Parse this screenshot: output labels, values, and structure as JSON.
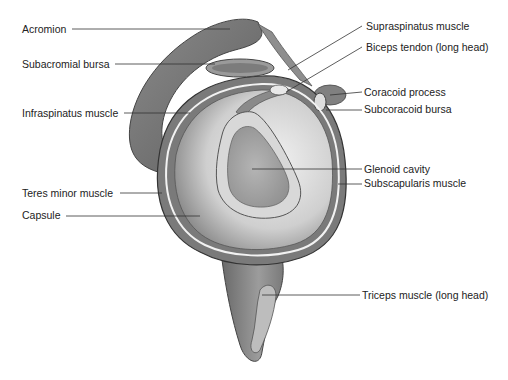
{
  "diagram": {
    "labels_left": [
      {
        "id": "acromion",
        "text": "Acromion",
        "x": 22,
        "y": 23
      },
      {
        "id": "subacromial-bursa",
        "text": "Subacromial bursa",
        "x": 22,
        "y": 58
      },
      {
        "id": "infraspinatus-muscle",
        "text": "Infraspinatus muscle",
        "x": 22,
        "y": 107
      },
      {
        "id": "teres-minor-muscle",
        "text": "Teres minor muscle",
        "x": 22,
        "y": 187
      },
      {
        "id": "capsule",
        "text": "Capsule",
        "x": 22,
        "y": 209
      }
    ],
    "labels_right": [
      {
        "id": "supraspinatus-muscle",
        "text": "Supraspinatus muscle",
        "x": 366,
        "y": 20
      },
      {
        "id": "biceps-tendon",
        "text": "Biceps tendon (long head)",
        "x": 366,
        "y": 41
      },
      {
        "id": "coracoid-process",
        "text": "Coracoid process",
        "x": 364,
        "y": 86
      },
      {
        "id": "subcoracoid-bursa",
        "text": "Subcoracoid bursa",
        "x": 364,
        "y": 103
      },
      {
        "id": "glenoid-cavity",
        "text": "Glenoid cavity",
        "x": 364,
        "y": 163
      },
      {
        "id": "subscapularis-muscle",
        "text": "Subscapularis muscle",
        "x": 364,
        "y": 177
      },
      {
        "id": "triceps-long-head",
        "text": "Triceps muscle (long head)",
        "x": 362,
        "y": 289
      }
    ],
    "colors": {
      "background": "#ffffff",
      "text": "#222222",
      "leader_line": "#333333",
      "bone_dark": "#6f6f6f",
      "bone_mid": "#9a9a9a",
      "cavity_light": "#e6e6e6",
      "glenoid": "#a8a8a8"
    }
  }
}
